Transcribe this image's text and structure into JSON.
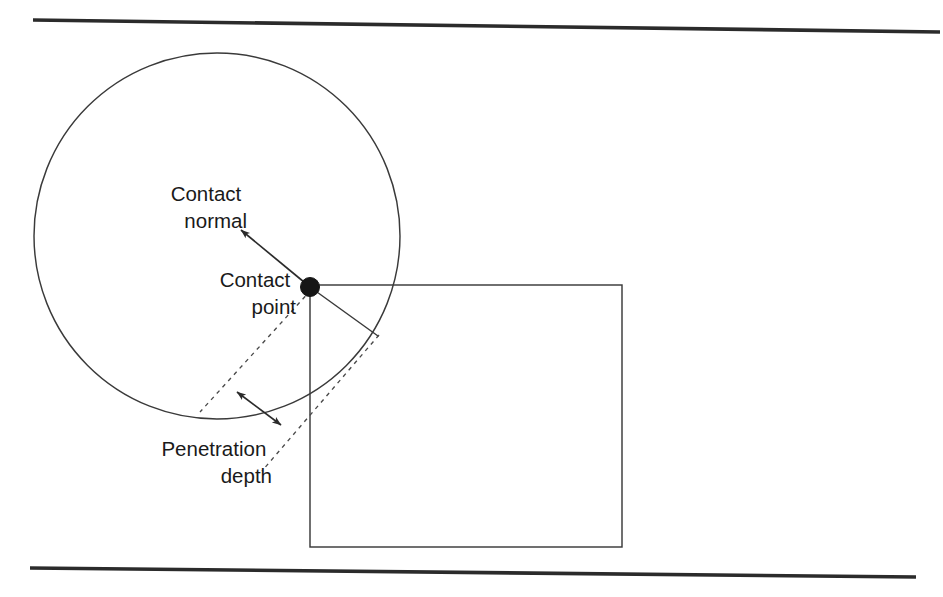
{
  "figure": {
    "background_color": "#ffffff",
    "line_color": "#2b2b2b",
    "dash_color": "#4a4a4a",
    "dot_color": "#161616",
    "width": 943,
    "height": 597
  },
  "labels": {
    "contact_normal_line1": "Contact",
    "contact_normal_line2": "normal",
    "contact_point_line1": "Contact",
    "contact_point_line2": "point",
    "penetration_depth_line1": "Penetration",
    "penetration_depth_line2": "depth"
  },
  "geometry": {
    "top_wall": {
      "x1": 33,
      "y1": 20,
      "x2": 940,
      "y2": 32
    },
    "bottom_wall": {
      "x1": 30,
      "y1": 568,
      "x2": 916,
      "y2": 577
    },
    "circle": {
      "cx": 217,
      "cy": 236,
      "r": 183
    },
    "box": {
      "x": 310,
      "y": 285,
      "width": 312,
      "height": 262
    },
    "contact_point": {
      "cx": 310,
      "cy": 287,
      "r": 9.5
    },
    "contact_normal_arrow": {
      "x1": 310,
      "y1": 287,
      "x2": 241,
      "y2": 230
    },
    "radius_segment": {
      "x1": 310,
      "y1": 287,
      "x2": 378,
      "y2": 336
    },
    "dashed_line_a": {
      "x1": 311,
      "y1": 290,
      "x2": 200,
      "y2": 412
    },
    "dashed_line_b": {
      "x1": 379,
      "y1": 335,
      "x2": 262,
      "y2": 471
    },
    "depth_double_arrow": {
      "x1": 237,
      "y1": 392,
      "x2": 281,
      "y2": 425
    }
  },
  "label_positions": {
    "contact_normal": {
      "x": 247,
      "y": 201,
      "anchor": "end"
    },
    "contact_point": {
      "x": 296,
      "y": 287,
      "anchor": "end"
    },
    "penetration_depth": {
      "x": 272,
      "y": 456,
      "anchor": "end"
    }
  }
}
